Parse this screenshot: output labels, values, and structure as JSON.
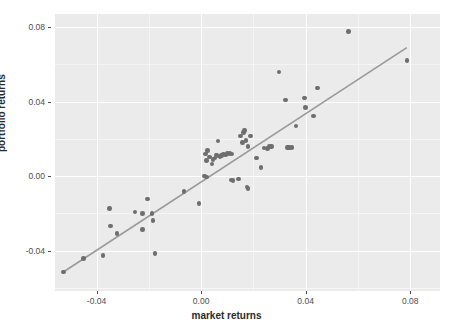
{
  "chart_data": {
    "type": "scatter",
    "title": "",
    "xlabel": "market returns",
    "ylabel": "portfolio returns",
    "xlim": [
      -0.0559,
      0.0914
    ],
    "ylim": [
      -0.0616,
      0.087
    ],
    "xticks": [
      -0.04,
      0.0,
      0.04,
      0.08
    ],
    "xtick_labels": [
      "-0.04",
      "0.00",
      "0.04",
      "0.08"
    ],
    "yticks": [
      -0.04,
      0.0,
      0.04,
      0.08
    ],
    "ytick_labels": [
      "-0.04",
      "0.00",
      "0.04",
      "0.08"
    ],
    "grid": true,
    "legend": "none",
    "point_color": "#6e6e6e",
    "line_color": "#9a9a9a",
    "panel_color": "#ebebeb",
    "grid_color": "#ffffff",
    "fit_line": {
      "type": "linear-regression",
      "x_start": -0.0527,
      "y_start": -0.0514,
      "x_end": 0.0787,
      "y_end": 0.069
    },
    "points": [
      {
        "x": -0.0527,
        "y": -0.0514
      },
      {
        "x": -0.0449,
        "y": -0.0441
      },
      {
        "x": -0.0375,
        "y": -0.0427
      },
      {
        "x": -0.0351,
        "y": -0.0173
      },
      {
        "x": -0.0347,
        "y": -0.0267
      },
      {
        "x": -0.0322,
        "y": -0.0307
      },
      {
        "x": -0.0253,
        "y": -0.0192
      },
      {
        "x": -0.0224,
        "y": -0.02
      },
      {
        "x": -0.0224,
        "y": -0.0286
      },
      {
        "x": -0.0204,
        "y": -0.0122
      },
      {
        "x": -0.0188,
        "y": -0.02
      },
      {
        "x": -0.0184,
        "y": -0.0237
      },
      {
        "x": -0.0176,
        "y": -0.0416
      },
      {
        "x": -0.0065,
        "y": -0.0082
      },
      {
        "x": -0.0008,
        "y": -0.0147
      },
      {
        "x": 0.0012,
        "y": 0.0
      },
      {
        "x": 0.0016,
        "y": 0.012
      },
      {
        "x": 0.002,
        "y": 0.0084
      },
      {
        "x": 0.002,
        "y": -0.0004
      },
      {
        "x": 0.0024,
        "y": 0.0137
      },
      {
        "x": 0.0033,
        "y": 0.0102
      },
      {
        "x": 0.0041,
        "y": 0.0065
      },
      {
        "x": 0.0045,
        "y": 0.009
      },
      {
        "x": 0.0053,
        "y": 0.0098
      },
      {
        "x": 0.0057,
        "y": 0.0114
      },
      {
        "x": 0.0061,
        "y": 0.011
      },
      {
        "x": 0.0065,
        "y": 0.0188
      },
      {
        "x": 0.0073,
        "y": 0.0106
      },
      {
        "x": 0.0078,
        "y": 0.011
      },
      {
        "x": 0.0086,
        "y": 0.0118
      },
      {
        "x": 0.0094,
        "y": 0.0114
      },
      {
        "x": 0.0102,
        "y": 0.0122
      },
      {
        "x": 0.011,
        "y": 0.0122
      },
      {
        "x": 0.0114,
        "y": -0.002
      },
      {
        "x": 0.0118,
        "y": 0.0118
      },
      {
        "x": 0.0122,
        "y": -0.0024
      },
      {
        "x": 0.0143,
        "y": -0.0016
      },
      {
        "x": 0.0151,
        "y": 0.0216
      },
      {
        "x": 0.0159,
        "y": 0.018
      },
      {
        "x": 0.0163,
        "y": 0.0233
      },
      {
        "x": 0.0167,
        "y": 0.0245
      },
      {
        "x": 0.0171,
        "y": 0.0192
      },
      {
        "x": 0.0175,
        "y": -0.0057
      },
      {
        "x": 0.0179,
        "y": 0.0159
      },
      {
        "x": 0.018,
        "y": -0.0065
      },
      {
        "x": 0.0188,
        "y": 0.0216
      },
      {
        "x": 0.0212,
        "y": 0.0098
      },
      {
        "x": 0.0229,
        "y": 0.0045
      },
      {
        "x": 0.0241,
        "y": 0.0151
      },
      {
        "x": 0.0253,
        "y": 0.0147
      },
      {
        "x": 0.0261,
        "y": 0.0159
      },
      {
        "x": 0.0269,
        "y": 0.0159
      },
      {
        "x": 0.0298,
        "y": 0.0559
      },
      {
        "x": 0.0322,
        "y": 0.0408
      },
      {
        "x": 0.033,
        "y": 0.0155
      },
      {
        "x": 0.0335,
        "y": 0.0155
      },
      {
        "x": 0.0339,
        "y": 0.0155
      },
      {
        "x": 0.0347,
        "y": 0.0155
      },
      {
        "x": 0.0363,
        "y": 0.0269
      },
      {
        "x": 0.0396,
        "y": 0.042
      },
      {
        "x": 0.04,
        "y": 0.0367
      },
      {
        "x": 0.0429,
        "y": 0.0322
      },
      {
        "x": 0.0445,
        "y": 0.0473
      },
      {
        "x": 0.0563,
        "y": 0.0775
      },
      {
        "x": 0.0787,
        "y": 0.062
      }
    ]
  },
  "axes": {
    "x_title": "market returns",
    "y_title": "portfolio returns"
  }
}
